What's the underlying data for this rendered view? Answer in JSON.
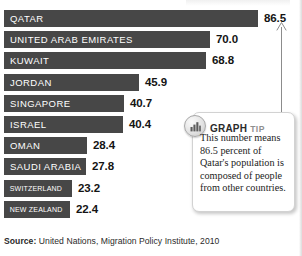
{
  "chart_data": {
    "type": "bar",
    "orientation": "horizontal",
    "title": "",
    "xlabel": "",
    "ylabel": "",
    "grid": false,
    "legend": false,
    "xlim": [
      0,
      86.5
    ],
    "categories": [
      "QATAR",
      "UNITED ARAB EMIRATES",
      "KUWAIT",
      "JORDAN",
      "SINGAPORE",
      "ISRAEL",
      "OMAN",
      "SAUDI ARABIA",
      "SWITZERLAND",
      "NEW ZEALAND"
    ],
    "values": [
      86.5,
      70.0,
      68.8,
      45.9,
      40.7,
      40.4,
      28.4,
      27.8,
      23.2,
      22.4
    ],
    "value_labels": [
      "86.5",
      "70.0",
      "68.8",
      "45.9",
      "40.7",
      "40.4",
      "28.4",
      "27.8",
      "23.2",
      "22.4"
    ],
    "units": "percent of population that is foreign-born",
    "bar_color": "#474747",
    "bar_label_color": "#ffffff",
    "value_color": "#141414"
  },
  "bars": [
    {
      "label": "QATAR",
      "value": "86.5",
      "width_px": 254,
      "label_size": "normal"
    },
    {
      "label": "UNITED ARAB EMIRATES",
      "value": "70.0",
      "width_px": 206,
      "label_size": "normal"
    },
    {
      "label": "KUWAIT",
      "value": "68.8",
      "width_px": 202,
      "label_size": "normal"
    },
    {
      "label": "JORDAN",
      "value": "45.9",
      "width_px": 135,
      "label_size": "normal"
    },
    {
      "label": "SINGAPORE",
      "value": "40.7",
      "width_px": 120,
      "label_size": "normal"
    },
    {
      "label": "ISRAEL",
      "value": "40.4",
      "width_px": 119,
      "label_size": "normal"
    },
    {
      "label": "OMAN",
      "value": "28.4",
      "width_px": 83,
      "label_size": "normal"
    },
    {
      "label": "SAUDI ARABIA",
      "value": "27.8",
      "width_px": 82,
      "label_size": "normal"
    },
    {
      "label": "SWITZERLAND",
      "value": "23.2",
      "width_px": 68,
      "label_size": "small"
    },
    {
      "label": "NEW ZEALAND",
      "value": "22.4",
      "width_px": 66,
      "label_size": "small"
    }
  ],
  "callout": {
    "icon": "bar-chart-icon",
    "heading_primary": "GRAPH",
    "heading_secondary": "TIP",
    "body": "This number means 86.5 percent of Qatar's population is composed of people from other countries.",
    "pointer_target_value": "86.5"
  },
  "source": {
    "prefix": "Source:",
    "text": "United Nations, Migration Policy Institute, 2010"
  },
  "colors": {
    "bar": "#474747",
    "bar_label": "#ffffff",
    "value_text": "#141414",
    "callout_bg": "#ffffff",
    "callout_border": "#d2d2d2",
    "tip_secondary": "#8f8f8f",
    "pointer": "#8c8c8c"
  }
}
